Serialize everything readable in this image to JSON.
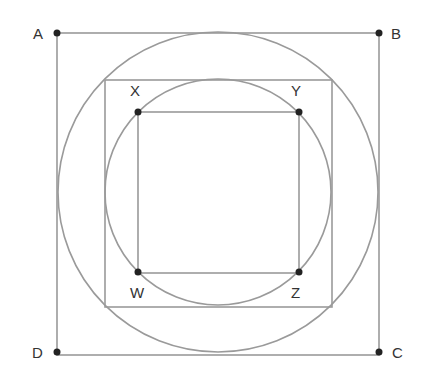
{
  "diagram": {
    "type": "geometry",
    "colors": {
      "line": "#9a9a9a",
      "point": "#222222",
      "label": "#333333",
      "background": "#ffffff"
    },
    "outer_square": {
      "vertices": [
        "A",
        "B",
        "C",
        "D"
      ],
      "x": 57,
      "y": 33,
      "size": 322
    },
    "outer_circle": {
      "cx": 218,
      "cy": 192,
      "r": 160
    },
    "middle_square": {
      "x": 105,
      "y": 80,
      "size": 227
    },
    "inner_circle": {
      "cx": 218,
      "cy": 192,
      "r": 113
    },
    "inner_square": {
      "vertices": [
        "W",
        "X",
        "Y",
        "Z"
      ],
      "x": 138,
      "y": 112,
      "size": 161
    },
    "points": [
      {
        "name": "A",
        "label": "A",
        "x": 57,
        "y": 33,
        "lx": 33,
        "ly": 39
      },
      {
        "name": "B",
        "label": "B",
        "x": 379,
        "y": 33,
        "lx": 391,
        "ly": 39
      },
      {
        "name": "C",
        "label": "C",
        "x": 379,
        "y": 352,
        "lx": 392,
        "ly": 358
      },
      {
        "name": "D",
        "label": "D",
        "x": 57,
        "y": 352,
        "lx": 32,
        "ly": 358
      },
      {
        "name": "X",
        "label": "X",
        "x": 138,
        "y": 112,
        "lx": 130,
        "ly": 96
      },
      {
        "name": "Y",
        "label": "Y",
        "x": 299,
        "y": 112,
        "lx": 291,
        "ly": 96
      },
      {
        "name": "Z",
        "label": "Z",
        "x": 299,
        "y": 272,
        "lx": 291,
        "ly": 298
      },
      {
        "name": "W",
        "label": "W",
        "x": 138,
        "y": 272,
        "lx": 130,
        "ly": 298
      }
    ]
  }
}
